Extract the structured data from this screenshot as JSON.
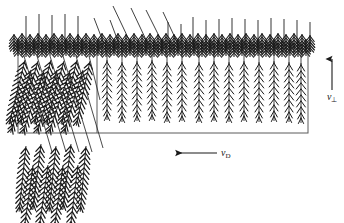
{
  "figure": {
    "type": "scientific-diagram",
    "background_color": "#ffffff",
    "ink_color": "#1a1a1a"
  },
  "frame": {
    "name": "simulation-box",
    "x": 18,
    "y": 52,
    "width": 290,
    "height": 81,
    "stroke": "#3a3a3a",
    "divider_x": 97
  },
  "annotations": {
    "vertical_velocity": {
      "symbol": "v",
      "subscript": "⊥",
      "text": "v",
      "sub": "⊥",
      "arrow_direction": "up",
      "arrow_x": 332,
      "arrow_y_top": 58,
      "arrow_y_bottom": 90
    },
    "drift_velocity": {
      "symbol": "v",
      "subscript": "D",
      "text": "v",
      "sub": "D",
      "arrow_direction": "left",
      "arrow_x_left": 178,
      "arrow_x_right": 217,
      "arrow_y": 153
    }
  },
  "plume_field": {
    "top_row": {
      "name": "top-dense-band",
      "count": 36,
      "x_start": 14,
      "x_end": 312,
      "baseline_y": 50,
      "plume_height": 18,
      "stem_extension": 26
    },
    "hanging_row_right": {
      "name": "hanging-plumes-right",
      "count": 15,
      "x_start": 105,
      "x_end": 300,
      "top_y": 62,
      "length": 62,
      "tilt_deg": 0
    },
    "tilted_row_left": {
      "name": "tilted-plumes-left",
      "count": 6,
      "x_start": 22,
      "x_end": 92,
      "top_y": 62,
      "length": 66,
      "tilt_deg": 22
    },
    "overflow_row_bottom": {
      "name": "overflow-plumes-below-box",
      "count": 5,
      "x_start": 22,
      "x_end": 88,
      "top_y": 146,
      "length": 70,
      "tilt_deg": 8
    },
    "long_diagonals": {
      "name": "long-diagonal-stems",
      "count": 6,
      "tilt_deg": 20,
      "top_y": 6
    }
  }
}
